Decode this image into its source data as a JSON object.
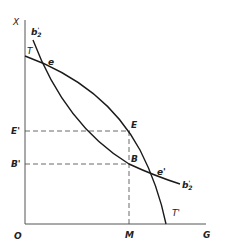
{
  "diagram": {
    "axes": {
      "y_axis_label": "X",
      "x_axis_label": "G",
      "origin_label": "O"
    },
    "curves": {
      "transformation_curve": {
        "start_label": "T",
        "end_label": "T'"
      },
      "indifference_curve": {
        "label_base": "b",
        "label_prime": "'",
        "label_sub": "2"
      }
    },
    "points": {
      "e": "e",
      "E": "E",
      "B": "B",
      "e_prime": "e'"
    },
    "axis_markers": {
      "E_prime": "E'",
      "B_prime": "B'",
      "M": "M"
    },
    "colors": {
      "line": "#1a1a1a",
      "dashed": "#444444"
    }
  }
}
